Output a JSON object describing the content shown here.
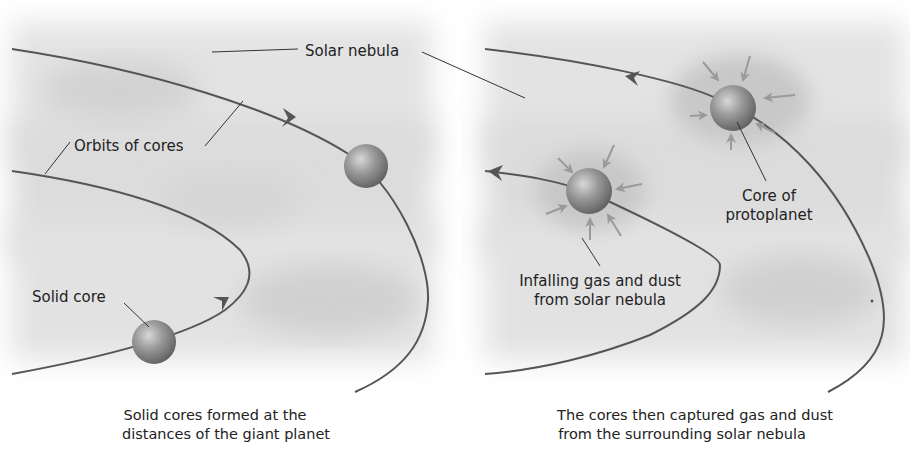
{
  "diagram": {
    "left_panel": {
      "labels": {
        "solar_nebula": "Solar nebula",
        "orbits_of_cores": "Orbits of cores",
        "solid_core": "Solid core"
      },
      "caption": {
        "line1": "Solid cores formed at the",
        "line2": "distances of the giant planet"
      }
    },
    "right_panel": {
      "labels": {
        "core_line1": "Core of",
        "core_line2": "protoplanet",
        "infall_line1": "Infalling gas and dust",
        "infall_line2": "from solar nebula"
      },
      "caption": {
        "line1": "The cores then captured gas and dust",
        "line2": "from the surrounding solar nebula"
      }
    },
    "colors": {
      "nebula": "#d9d9d9",
      "orbit": "#555555",
      "core": "#8a8a8a",
      "infall_arrow": "#9a9a9a",
      "text": "#222222"
    }
  }
}
